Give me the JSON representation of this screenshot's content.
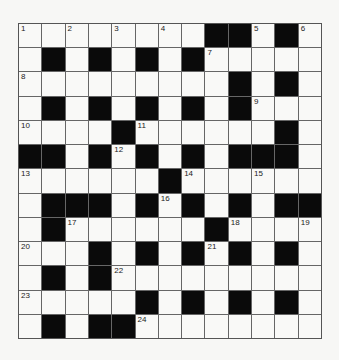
{
  "puzzle": {
    "rows": 13,
    "cols": 13,
    "grid": [
      [
        "1",
        "",
        "2",
        "",
        "3",
        "",
        "4",
        "",
        "#",
        "#",
        "5",
        "#",
        "6"
      ],
      [
        "",
        "#",
        "",
        "#",
        "",
        "#",
        "",
        "#",
        "7",
        "",
        "",
        "",
        ""
      ],
      [
        "8",
        "",
        "",
        "",
        "",
        "",
        "",
        "",
        "",
        "#",
        "",
        "#",
        ""
      ],
      [
        "",
        "#",
        "",
        "#",
        "",
        "#",
        "",
        "#",
        "",
        "#",
        "9",
        "",
        ""
      ],
      [
        "10",
        "",
        "",
        "",
        "#",
        "11",
        "",
        "",
        "",
        "",
        "",
        "#",
        ""
      ],
      [
        "#",
        "#",
        "",
        "#",
        "12",
        "#",
        "",
        "#",
        "",
        "#",
        "#",
        "#",
        ""
      ],
      [
        "13",
        "",
        "",
        "",
        "",
        "",
        "#",
        "14",
        "",
        "",
        "15",
        "",
        ""
      ],
      [
        "",
        "#",
        "#",
        "#",
        "",
        "#",
        "16",
        "#",
        "",
        "#",
        "",
        "#",
        "#"
      ],
      [
        "",
        "#",
        "17",
        "",
        "",
        "",
        "",
        "",
        "#",
        "18",
        "",
        "",
        "19"
      ],
      [
        "20",
        "",
        "",
        "#",
        "",
        "#",
        "",
        "#",
        "21",
        "#",
        "",
        "#",
        ""
      ],
      [
        "",
        "#",
        "",
        "#",
        "22",
        "",
        "",
        "",
        "",
        "",
        "",
        "",
        ""
      ],
      [
        "23",
        "",
        "",
        "",
        "",
        "#",
        "",
        "#",
        "",
        "#",
        "",
        "#",
        ""
      ],
      [
        "",
        "#",
        "",
        "#",
        "#",
        "24",
        "",
        "",
        "",
        "",
        "",
        "",
        ""
      ]
    ]
  }
}
